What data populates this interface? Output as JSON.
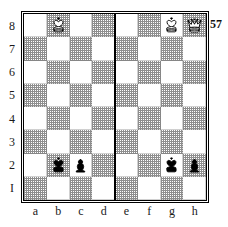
{
  "diagram": {
    "number": "57",
    "type": "chess-position",
    "orientation": "white-bottom",
    "center_divider": true,
    "colors": {
      "light_square": "#ffffff",
      "dark_square": "#8e8e8e",
      "border": "#000000",
      "label_text": "#1a1a1a",
      "white_piece_fill": "#ffffff",
      "black_piece_fill": "#000000",
      "piece_outline": "#000000"
    }
  },
  "labels": {
    "ranks": [
      "8",
      "7",
      "6",
      "5",
      "4",
      "3",
      "2",
      "I"
    ],
    "files": [
      "a",
      "b",
      "c",
      "d",
      "e",
      "f",
      "g",
      "h"
    ]
  },
  "board": {
    "squares": [
      [
        {
          "id": "a8",
          "shade": "light",
          "piece": null
        },
        {
          "id": "b8",
          "shade": "dark",
          "piece": "white-king"
        },
        {
          "id": "c8",
          "shade": "light",
          "piece": null
        },
        {
          "id": "d8",
          "shade": "dark",
          "piece": null
        },
        {
          "id": "e8",
          "shade": "light",
          "piece": null
        },
        {
          "id": "f8",
          "shade": "dark",
          "piece": null
        },
        {
          "id": "g8",
          "shade": "light",
          "piece": "white-king"
        },
        {
          "id": "h8",
          "shade": "dark",
          "piece": "white-queen"
        }
      ],
      [
        {
          "id": "a7",
          "shade": "dark",
          "piece": null
        },
        {
          "id": "b7",
          "shade": "light",
          "piece": null
        },
        {
          "id": "c7",
          "shade": "dark",
          "piece": null
        },
        {
          "id": "d7",
          "shade": "light",
          "piece": null
        },
        {
          "id": "e7",
          "shade": "dark",
          "piece": null
        },
        {
          "id": "f7",
          "shade": "light",
          "piece": null
        },
        {
          "id": "g7",
          "shade": "dark",
          "piece": null
        },
        {
          "id": "h7",
          "shade": "light",
          "piece": null
        }
      ],
      [
        {
          "id": "a6",
          "shade": "light",
          "piece": null
        },
        {
          "id": "b6",
          "shade": "dark",
          "piece": null
        },
        {
          "id": "c6",
          "shade": "light",
          "piece": null
        },
        {
          "id": "d6",
          "shade": "dark",
          "piece": null
        },
        {
          "id": "e6",
          "shade": "light",
          "piece": null
        },
        {
          "id": "f6",
          "shade": "dark",
          "piece": null
        },
        {
          "id": "g6",
          "shade": "light",
          "piece": null
        },
        {
          "id": "h6",
          "shade": "dark",
          "piece": null
        }
      ],
      [
        {
          "id": "a5",
          "shade": "dark",
          "piece": null
        },
        {
          "id": "b5",
          "shade": "light",
          "piece": null
        },
        {
          "id": "c5",
          "shade": "dark",
          "piece": null
        },
        {
          "id": "d5",
          "shade": "light",
          "piece": null
        },
        {
          "id": "e5",
          "shade": "dark",
          "piece": null
        },
        {
          "id": "f5",
          "shade": "light",
          "piece": null
        },
        {
          "id": "g5",
          "shade": "dark",
          "piece": null
        },
        {
          "id": "h5",
          "shade": "light",
          "piece": null
        }
      ],
      [
        {
          "id": "a4",
          "shade": "light",
          "piece": null
        },
        {
          "id": "b4",
          "shade": "dark",
          "piece": null
        },
        {
          "id": "c4",
          "shade": "light",
          "piece": null
        },
        {
          "id": "d4",
          "shade": "dark",
          "piece": null
        },
        {
          "id": "e4",
          "shade": "light",
          "piece": null
        },
        {
          "id": "f4",
          "shade": "dark",
          "piece": null
        },
        {
          "id": "g4",
          "shade": "light",
          "piece": null
        },
        {
          "id": "h4",
          "shade": "dark",
          "piece": null
        }
      ],
      [
        {
          "id": "a3",
          "shade": "dark",
          "piece": null
        },
        {
          "id": "b3",
          "shade": "light",
          "piece": null
        },
        {
          "id": "c3",
          "shade": "dark",
          "piece": null
        },
        {
          "id": "d3",
          "shade": "light",
          "piece": null
        },
        {
          "id": "e3",
          "shade": "dark",
          "piece": null
        },
        {
          "id": "f3",
          "shade": "light",
          "piece": null
        },
        {
          "id": "g3",
          "shade": "dark",
          "piece": null
        },
        {
          "id": "h3",
          "shade": "light",
          "piece": null
        }
      ],
      [
        {
          "id": "a2",
          "shade": "light",
          "piece": null
        },
        {
          "id": "b2",
          "shade": "dark",
          "piece": "black-king"
        },
        {
          "id": "c2",
          "shade": "light",
          "piece": "black-pawn"
        },
        {
          "id": "d2",
          "shade": "dark",
          "piece": null
        },
        {
          "id": "e2",
          "shade": "light",
          "piece": null
        },
        {
          "id": "f2",
          "shade": "dark",
          "piece": null
        },
        {
          "id": "g2",
          "shade": "light",
          "piece": "black-king"
        },
        {
          "id": "h2",
          "shade": "dark",
          "piece": "black-pawn"
        }
      ],
      [
        {
          "id": "a1",
          "shade": "dark",
          "piece": null
        },
        {
          "id": "b1",
          "shade": "light",
          "piece": null
        },
        {
          "id": "c1",
          "shade": "dark",
          "piece": null
        },
        {
          "id": "d1",
          "shade": "light",
          "piece": null
        },
        {
          "id": "e1",
          "shade": "dark",
          "piece": null
        },
        {
          "id": "f1",
          "shade": "light",
          "piece": null
        },
        {
          "id": "g1",
          "shade": "dark",
          "piece": null
        },
        {
          "id": "h1",
          "shade": "light",
          "piece": null
        }
      ]
    ]
  },
  "position": {
    "white": [
      {
        "piece": "queen",
        "square": "a8"
      },
      {
        "piece": "king",
        "square": "b8"
      },
      {
        "piece": "king",
        "square": "g8"
      },
      {
        "piece": "queen",
        "square": "h8"
      }
    ],
    "black": [
      {
        "piece": "king",
        "square": "b2"
      },
      {
        "piece": "pawn",
        "square": "c2"
      },
      {
        "piece": "king",
        "square": "g2"
      },
      {
        "piece": "pawn",
        "square": "h2"
      }
    ]
  }
}
